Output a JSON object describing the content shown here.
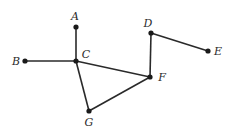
{
  "diagram": {
    "type": "graph",
    "nodes": [
      {
        "id": "A",
        "label": "A",
        "x": 76,
        "y": 27,
        "lx": 75,
        "ly": 20,
        "anchor": "middle"
      },
      {
        "id": "B",
        "label": "B",
        "x": 25,
        "y": 61,
        "lx": 16,
        "ly": 65,
        "anchor": "middle"
      },
      {
        "id": "C",
        "label": "C",
        "x": 76,
        "y": 61,
        "lx": 86,
        "ly": 58,
        "anchor": "middle"
      },
      {
        "id": "D",
        "label": "D",
        "x": 151,
        "y": 33,
        "lx": 148,
        "ly": 27,
        "anchor": "middle"
      },
      {
        "id": "E",
        "label": "E",
        "x": 208,
        "y": 51,
        "lx": 218,
        "ly": 55,
        "anchor": "middle"
      },
      {
        "id": "F",
        "label": "F",
        "x": 150,
        "y": 77,
        "lx": 162,
        "ly": 81,
        "anchor": "middle"
      },
      {
        "id": "G",
        "label": "G",
        "x": 89,
        "y": 111,
        "lx": 89,
        "ly": 126,
        "anchor": "middle"
      }
    ],
    "edges": [
      [
        "A",
        "C"
      ],
      [
        "B",
        "C"
      ],
      [
        "C",
        "F"
      ],
      [
        "C",
        "G"
      ],
      [
        "G",
        "F"
      ],
      [
        "D",
        "F"
      ],
      [
        "D",
        "E"
      ]
    ]
  }
}
